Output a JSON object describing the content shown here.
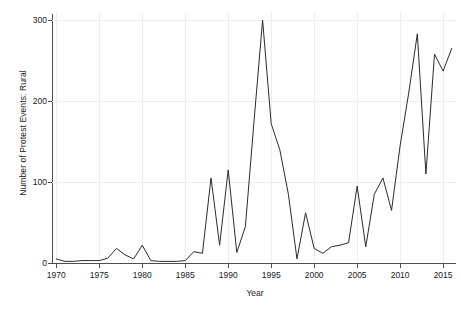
{
  "chart_data": {
    "type": "line",
    "title": "",
    "xlabel": "Year",
    "ylabel": "Number of Protest Events: Rural",
    "xlim": [
      1969.5,
      2016.5
    ],
    "ylim": [
      0,
      310
    ],
    "xticks": [
      1970,
      1975,
      1980,
      1985,
      1990,
      1995,
      2000,
      2005,
      2010,
      2015
    ],
    "yticks": [
      0,
      100,
      200,
      300
    ],
    "grid": true,
    "legend": null,
    "line_color": "#2b2b2b",
    "x": [
      1970,
      1971,
      1972,
      1973,
      1974,
      1975,
      1976,
      1977,
      1978,
      1979,
      1980,
      1981,
      1982,
      1983,
      1984,
      1985,
      1986,
      1987,
      1988,
      1989,
      1990,
      1991,
      1992,
      1993,
      1994,
      1995,
      1996,
      1997,
      1998,
      1999,
      2000,
      2001,
      2002,
      2003,
      2004,
      2005,
      2006,
      2007,
      2008,
      2009,
      2010,
      2011,
      2012,
      2013,
      2014,
      2015,
      2016
    ],
    "values": [
      5,
      2,
      2,
      3,
      3,
      3,
      6,
      18,
      10,
      5,
      22,
      3,
      2,
      2,
      2,
      3,
      14,
      12,
      105,
      22,
      115,
      13,
      45,
      175,
      300,
      172,
      140,
      85,
      5,
      62,
      18,
      12,
      20,
      22,
      25,
      95,
      20,
      85,
      105,
      65,
      145,
      210,
      283,
      110,
      258,
      237,
      265
    ],
    "series": [
      {
        "name": "Number of Protest Events: Rural",
        "values": [
          5,
          2,
          2,
          3,
          3,
          3,
          6,
          18,
          10,
          5,
          22,
          3,
          2,
          2,
          2,
          3,
          14,
          12,
          105,
          22,
          115,
          13,
          45,
          175,
          300,
          172,
          140,
          85,
          5,
          62,
          18,
          12,
          20,
          22,
          25,
          95,
          20,
          85,
          105,
          65,
          145,
          210,
          283,
          110,
          258,
          237,
          265
        ]
      }
    ]
  },
  "axis": {
    "ylabel_text": "Number of Protest Events: Rural",
    "xlabel_text": "Year",
    "ytick_texts": [
      "0",
      "100",
      "200",
      "300"
    ],
    "xtick_texts": [
      "1970",
      "1975",
      "1980",
      "1985",
      "1990",
      "1995",
      "2000",
      "2005",
      "2010",
      "2015"
    ]
  }
}
